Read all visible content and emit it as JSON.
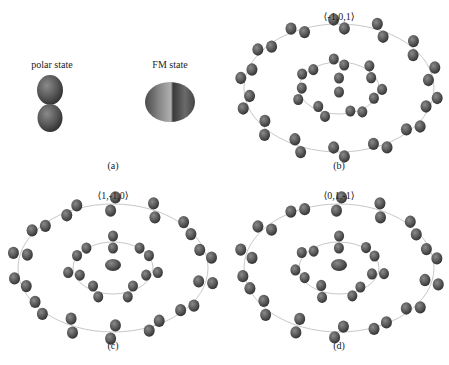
{
  "figure": {
    "panels": [
      {
        "id": "a",
        "caption": "(a)",
        "items": [
          {
            "label": "polar state",
            "shape": "dumbbell-vertical"
          },
          {
            "label": "FM state",
            "shape": "oblate-ellipsoid"
          }
        ]
      },
      {
        "id": "b",
        "title": "⟨-1,0,1⟩",
        "caption": "(b)"
      },
      {
        "id": "c",
        "title": "⟨1,-1,0⟩",
        "caption": "(c)"
      },
      {
        "id": "d",
        "title": "⟨0,1,-1⟩",
        "caption": "(d)"
      }
    ]
  },
  "colors": {
    "lobe_dark": "#3e3e3e",
    "lobe_mid": "#6a6a6a",
    "lobe_light": "#9a9a9a",
    "ring": "#c8c8c8"
  }
}
